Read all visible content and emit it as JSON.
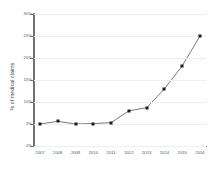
{
  "chart_data": {
    "type": "line",
    "title": "",
    "subtitle": "",
    "xlabel": "",
    "ylabel": "% of medical claims",
    "categories": [
      "2007",
      "2008",
      "2009",
      "2010",
      "2011",
      "2012",
      "2013",
      "2014",
      "2015",
      "2016"
    ],
    "values": [
      5.0,
      5.6,
      5.0,
      5.1,
      5.3,
      8.0,
      8.7,
      13.0,
      18.2,
      25.0
    ],
    "series": [
      {
        "name": "% of medical claims",
        "values": [
          5.0,
          5.6,
          5.0,
          5.1,
          5.3,
          8.0,
          8.7,
          13.0,
          18.2,
          25.0
        ]
      }
    ],
    "ylim": [
      0,
      30
    ],
    "xlim": [
      "2007",
      "2016"
    ],
    "y_ticks": [
      0,
      5,
      10,
      15,
      20,
      25,
      30
    ],
    "y_tick_labels": [
      "0%",
      "5%",
      "10%",
      "15%",
      "20%",
      "25%",
      "30%"
    ],
    "x_tick_labels": [
      "2007",
      "2008",
      "2009",
      "2010",
      "2011",
      "2012",
      "2013",
      "2014",
      "2015",
      "2016"
    ],
    "grid": true,
    "grid_axis": "y",
    "legend": false,
    "legend_position": "none",
    "marker": "square",
    "line_color": "#6b6b70",
    "marker_color": "#1b1b1b",
    "grid_color": "#ededf2",
    "axis_color": "#6f6f74",
    "background_color": "#ffffff"
  }
}
